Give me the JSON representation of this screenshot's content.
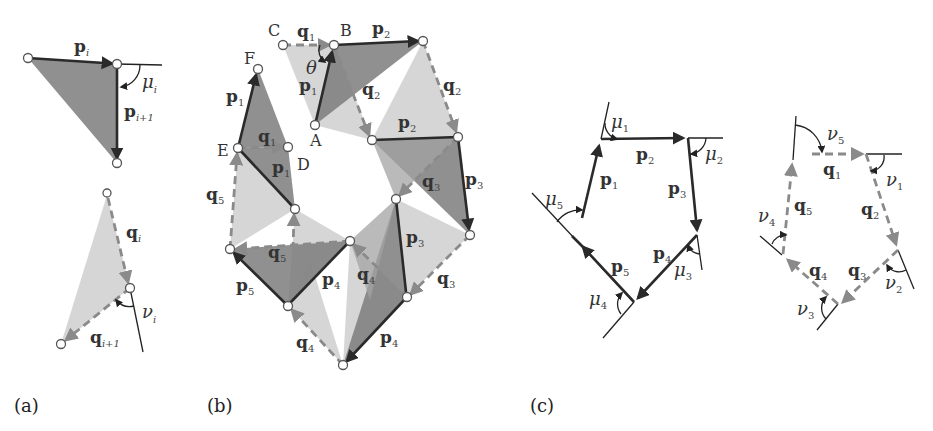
{
  "figure": {
    "panels": [
      {
        "id": "a",
        "caption": "(a)"
      },
      {
        "id": "b",
        "caption": "(b)"
      },
      {
        "id": "c",
        "caption": "(c)"
      }
    ],
    "colors": {
      "p_edge": "#2a2a2a",
      "q_edge": "#8a8a8a",
      "dark_triangle": "#7d7d7d",
      "light_triangle": "#cfcfcf"
    }
  },
  "panel_a": {
    "upper": {
      "edge_top": {
        "vec": "p",
        "sub": "i"
      },
      "edge_right": {
        "vec": "p",
        "sub": "i+1"
      },
      "angle": {
        "sym": "μ",
        "sub": "i"
      }
    },
    "lower": {
      "edge_top": {
        "vec": "q",
        "sub": "i"
      },
      "edge_bottom": {
        "vec": "q",
        "sub": "i+1"
      },
      "angle": {
        "sym": "ν",
        "sub": "i"
      }
    }
  },
  "panel_b": {
    "points": {
      "A": "A",
      "B": "B",
      "C": "C",
      "D": "D",
      "E": "E",
      "F": "F"
    },
    "theta": "θ",
    "labels": [
      {
        "vec": "q",
        "sub": "1"
      },
      {
        "vec": "p",
        "sub": "2"
      },
      {
        "vec": "p",
        "sub": "1"
      },
      {
        "vec": "q",
        "sub": "2"
      },
      {
        "vec": "q",
        "sub": "2"
      },
      {
        "vec": "p",
        "sub": "2"
      },
      {
        "vec": "p",
        "sub": "1"
      },
      {
        "vec": "q",
        "sub": "1"
      },
      {
        "vec": "p",
        "sub": "1"
      },
      {
        "vec": "q",
        "sub": "3"
      },
      {
        "vec": "p",
        "sub": "3"
      },
      {
        "vec": "q",
        "sub": "5"
      },
      {
        "vec": "p",
        "sub": "3"
      },
      {
        "vec": "q",
        "sub": "5"
      },
      {
        "vec": "p",
        "sub": "5"
      },
      {
        "vec": "p",
        "sub": "4"
      },
      {
        "vec": "q",
        "sub": "4"
      },
      {
        "vec": "q",
        "sub": "3"
      },
      {
        "vec": "q",
        "sub": "4"
      },
      {
        "vec": "p",
        "sub": "4"
      }
    ]
  },
  "panel_c": {
    "p_polygon": {
      "edges": [
        {
          "vec": "p",
          "sub": "1"
        },
        {
          "vec": "p",
          "sub": "2"
        },
        {
          "vec": "p",
          "sub": "3"
        },
        {
          "vec": "p",
          "sub": "4"
        },
        {
          "vec": "p",
          "sub": "5"
        }
      ],
      "angles": [
        {
          "sym": "μ",
          "sub": "1"
        },
        {
          "sym": "μ",
          "sub": "2"
        },
        {
          "sym": "μ",
          "sub": "3"
        },
        {
          "sym": "μ",
          "sub": "4"
        },
        {
          "sym": "μ",
          "sub": "5"
        }
      ]
    },
    "q_polygon": {
      "edges": [
        {
          "vec": "q",
          "sub": "1"
        },
        {
          "vec": "q",
          "sub": "2"
        },
        {
          "vec": "q",
          "sub": "3"
        },
        {
          "vec": "q",
          "sub": "4"
        },
        {
          "vec": "q",
          "sub": "5"
        }
      ],
      "angles": [
        {
          "sym": "ν",
          "sub": "1"
        },
        {
          "sym": "ν",
          "sub": "2"
        },
        {
          "sym": "ν",
          "sub": "3"
        },
        {
          "sym": "ν",
          "sub": "4"
        },
        {
          "sym": "ν",
          "sub": "5"
        }
      ]
    }
  }
}
